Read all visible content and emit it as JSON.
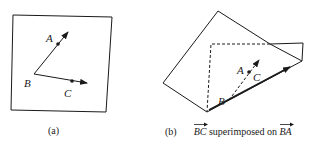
{
  "panel_a": {
    "caption": "(a)",
    "points": {
      "A": "A",
      "B": "B",
      "C": "C"
    }
  },
  "panel_b": {
    "caption_prefix": "(b)",
    "vector_1": "BC",
    "caption_middle": "superimposed on",
    "vector_2": "BA",
    "points": {
      "A": "A",
      "B": "B",
      "C": "C"
    }
  },
  "colors": {
    "stroke": "#1a1a1a",
    "background": "#ffffff"
  }
}
